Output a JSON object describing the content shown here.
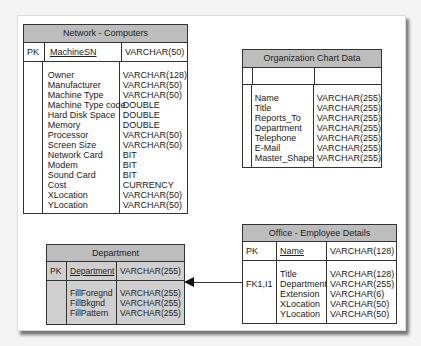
{
  "tables": {
    "network": {
      "title": "Network - Computers",
      "pk_label": "PK",
      "pk_field": "MachineSN",
      "pk_type": "VARCHAR(50)",
      "fields": [
        "Owner",
        "Manufacturer",
        "Machine Type",
        "Machine Type code",
        "Hard Disk Space",
        "Memory",
        "Processor",
        "Screen Size",
        "Network Card",
        "Modem",
        "Sound Card",
        "Cost",
        "XLocation",
        "YLocation"
      ],
      "types": [
        "VARCHAR(128)",
        "VARCHAR(50)",
        "VARCHAR(50)",
        "DOUBLE",
        "DOUBLE",
        "DOUBLE",
        "VARCHAR(50)",
        "VARCHAR(50)",
        "BIT",
        "BIT",
        "BIT",
        "CURRENCY",
        "VARCHAR(50)",
        "VARCHAR(50)"
      ]
    },
    "org": {
      "title": "Organization Chart Data",
      "fields": [
        "Name",
        "Title",
        "Reports_To",
        "Department",
        "Telephone",
        "E-Mail",
        "Master_Shape"
      ],
      "types": [
        "VARCHAR(255)",
        "VARCHAR(255)",
        "VARCHAR(255)",
        "VARCHAR(255)",
        "VARCHAR(255)",
        "VARCHAR(255)",
        "VARCHAR(255)"
      ]
    },
    "department": {
      "title": "Department",
      "pk_label": "PK",
      "pk_field": "Department",
      "pk_type": "VARCHAR(255)",
      "fields": [
        "FillForegnd",
        "FillBkgnd",
        "FillPattern"
      ],
      "types": [
        "VARCHAR(255)",
        "VARCHAR(255)",
        "VARCHAR(255)"
      ]
    },
    "office": {
      "title": "Office - Employee Details",
      "pk_label": "PK",
      "pk_field": "Name",
      "pk_type": "VARCHAR(128)",
      "fk_label": "FK1,I1",
      "fields": [
        "Title",
        "Department",
        "Extension",
        "XLocation",
        "YLocation"
      ],
      "types": [
        "VARCHAR(128)",
        "VARCHAR(255)",
        "VARCHAR(6)",
        "VARCHAR(50)",
        "VARCHAR(50)"
      ]
    }
  },
  "relationships": [
    {
      "from": "Office - Employee Details.Department",
      "to": "Department.Department"
    }
  ]
}
